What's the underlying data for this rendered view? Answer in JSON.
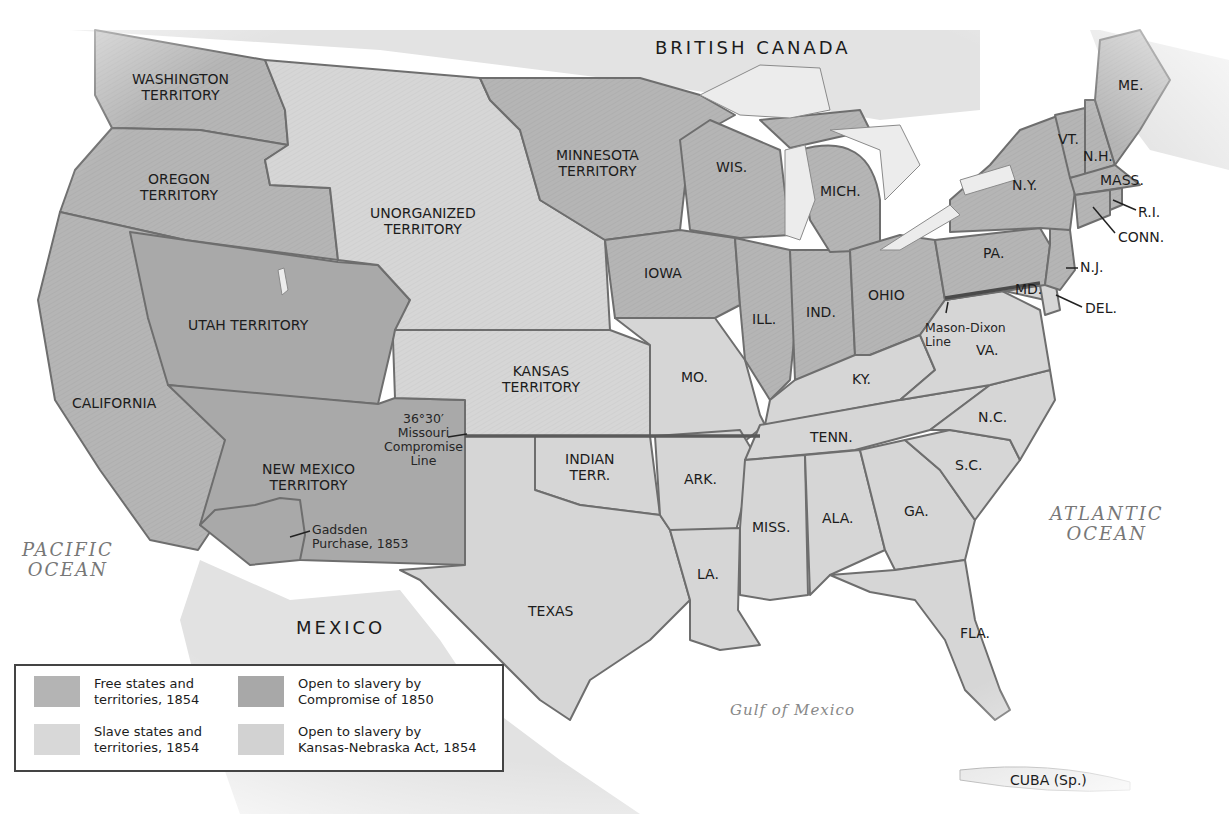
{
  "map": {
    "colors": {
      "free": "#b4b4b4",
      "slave": "#d8d8d8",
      "compromise1850": "#a8a8a8",
      "kansas_nebraska": "#d2d2d2",
      "foreign": "#e6e6e6",
      "water": "#ffffff",
      "lake": "#ececec",
      "border": "#6e6e6e"
    },
    "countries": {
      "canada": "BRITISH CANADA",
      "mexico": "MEXICO",
      "cuba": "CUBA (Sp.)"
    },
    "water": {
      "pacific_1": "PACIFIC",
      "pacific_2": "OCEAN",
      "atlantic_1": "ATLANTIC",
      "atlantic_2": "OCEAN",
      "gulf": "Gulf of Mexico"
    },
    "territories": {
      "washington_1": "WASHINGTON",
      "washington_2": "TERRITORY",
      "oregon_1": "OREGON",
      "oregon_2": "TERRITORY",
      "california": "CALIFORNIA",
      "utah": "UTAH TERRITORY",
      "newmexico_1": "NEW MEXICO",
      "newmexico_2": "TERRITORY",
      "unorganized_1": "UNORGANIZED",
      "unorganized_2": "TERRITORY",
      "minnesota_1": "MINNESOTA",
      "minnesota_2": "TERRITORY",
      "kansas_1": "KANSAS",
      "kansas_2": "TERRITORY",
      "indian_1": "INDIAN",
      "indian_2": "TERR."
    },
    "states": {
      "texas": "TEXAS",
      "iowa": "IOWA",
      "mo": "MO.",
      "ark": "ARK.",
      "la": "LA.",
      "wis": "WIS.",
      "ill": "ILL.",
      "mich": "MICH.",
      "ind": "IND.",
      "ohio": "OHIO",
      "ky": "KY.",
      "tenn": "TENN.",
      "miss": "MISS.",
      "ala": "ALA.",
      "ga": "GA.",
      "fla": "FLA.",
      "sc": "S.C.",
      "nc": "N.C.",
      "va": "VA.",
      "md": "MD.",
      "del": "DEL.",
      "pa": "PA.",
      "nj": "N.J.",
      "ny": "N.Y.",
      "conn": "CONN.",
      "ri": "R.I.",
      "mass": "MASS.",
      "vt": "VT.",
      "nh": "N.H.",
      "me": "ME."
    },
    "annotations": {
      "missouri_1": "36°30′",
      "missouri_2": "Missouri",
      "missouri_3": "Compromise",
      "missouri_4": "Line",
      "gadsden_1": "Gadsden",
      "gadsden_2": "Purchase, 1853",
      "masondixon_1": "Mason-Dixon",
      "masondixon_2": "Line"
    }
  },
  "legend": {
    "items": [
      {
        "line1": "Free states and",
        "line2": "territories, 1854",
        "color": "#b4b4b4"
      },
      {
        "line1": "Open to slavery by",
        "line2": "Compromise of 1850",
        "color": "#a8a8a8"
      },
      {
        "line1": "Slave states and",
        "line2": "territories, 1854",
        "color": "#d8d8d8"
      },
      {
        "line1": "Open to slavery by",
        "line2": "Kansas-Nebraska Act, 1854",
        "color": "#d2d2d2"
      }
    ]
  }
}
